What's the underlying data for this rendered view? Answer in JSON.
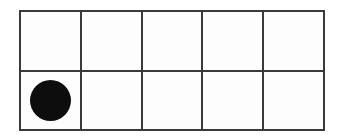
{
  "figure": {
    "type": "ten-frame",
    "rows": 2,
    "columns": 5,
    "total_cells": 10,
    "filled_count": 1,
    "empty_count": 9,
    "background_color": "#ffffff",
    "grid_line_color": "#3a3a3a",
    "grid_line_width_px": 2,
    "counter_color": "#0d0d0d",
    "counter_shape": "circle",
    "counter_diameter_px": 41
  },
  "cells": [
    {
      "index": 0,
      "row": 0,
      "column": 0,
      "filled": false,
      "label": ""
    },
    {
      "index": 1,
      "row": 0,
      "column": 1,
      "filled": false,
      "label": ""
    },
    {
      "index": 2,
      "row": 0,
      "column": 2,
      "filled": false,
      "label": ""
    },
    {
      "index": 3,
      "row": 0,
      "column": 3,
      "filled": false,
      "label": ""
    },
    {
      "index": 4,
      "row": 0,
      "column": 4,
      "filled": false,
      "label": ""
    },
    {
      "index": 5,
      "row": 1,
      "column": 0,
      "filled": true,
      "label": ""
    },
    {
      "index": 6,
      "row": 1,
      "column": 1,
      "filled": false,
      "label": ""
    },
    {
      "index": 7,
      "row": 1,
      "column": 2,
      "filled": false,
      "label": ""
    },
    {
      "index": 8,
      "row": 1,
      "column": 3,
      "filled": false,
      "label": ""
    },
    {
      "index": 9,
      "row": 1,
      "column": 4,
      "filled": false,
      "label": ""
    }
  ]
}
